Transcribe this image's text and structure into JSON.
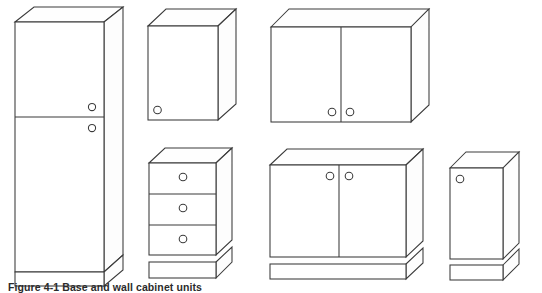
{
  "figure": {
    "caption": "Figure 4-1 Base and wall cabinet units",
    "background_color": "#ffffff",
    "line_color": "#3a3a3a",
    "projection": "oblique / isometric line drawing"
  },
  "units": [
    {
      "id": "tall-larder-unit",
      "name": "Tall two-door larder unit",
      "doors": 2,
      "drawers": 0,
      "handles": 2,
      "has_plinth": true,
      "position": "left"
    },
    {
      "id": "wall-unit-single",
      "name": "Single-door wall unit",
      "doors": 1,
      "drawers": 0,
      "handles": 1,
      "has_plinth": false,
      "position": "top-centre-left"
    },
    {
      "id": "wall-unit-double",
      "name": "Two-door wall unit",
      "doors": 2,
      "drawers": 0,
      "handles": 2,
      "has_plinth": false,
      "position": "top-right"
    },
    {
      "id": "drawer-base-unit",
      "name": "Three-drawer base unit",
      "doors": 0,
      "drawers": 3,
      "handles": 3,
      "has_plinth": true,
      "position": "bottom-centre-left"
    },
    {
      "id": "base-unit-double",
      "name": "Two-door base unit",
      "doors": 2,
      "drawers": 0,
      "handles": 2,
      "has_plinth": true,
      "position": "bottom-centre-right"
    },
    {
      "id": "base-unit-single",
      "name": "Single-door base unit",
      "doors": 1,
      "drawers": 0,
      "handles": 1,
      "has_plinth": true,
      "position": "bottom-right"
    }
  ]
}
